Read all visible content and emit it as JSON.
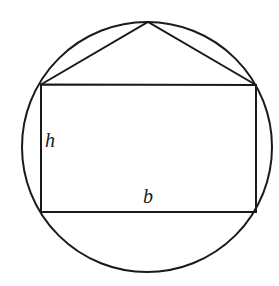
{
  "figure": {
    "kind": "geometry-diagram",
    "background_color": "#ffffff",
    "stroke_color": "#1a1a1a",
    "stroke_width": 2,
    "canvas": {
      "width": 279,
      "height": 286
    },
    "circle": {
      "name": "circumscribed-circle",
      "center_x": 147,
      "center_y": 147,
      "radius": 125
    },
    "rectangle": {
      "name": "inscribed-rectangle",
      "left": 41,
      "top": 84.5,
      "right": 256,
      "bottom": 212,
      "width": 215,
      "height": 127.5
    },
    "triangle": {
      "name": "apex-triangle",
      "apex_x": 148,
      "apex_y": 22,
      "left_base_x": 41,
      "left_base_y": 84.5,
      "right_base_x": 256,
      "right_base_y": 85
    },
    "labels": [
      {
        "id": "h",
        "text": "h",
        "meaning": "height of rectangle",
        "x": 52,
        "y": 142
      },
      {
        "id": "b",
        "text": "b",
        "meaning": "base of rectangle",
        "x": 150,
        "y": 197
      }
    ]
  }
}
